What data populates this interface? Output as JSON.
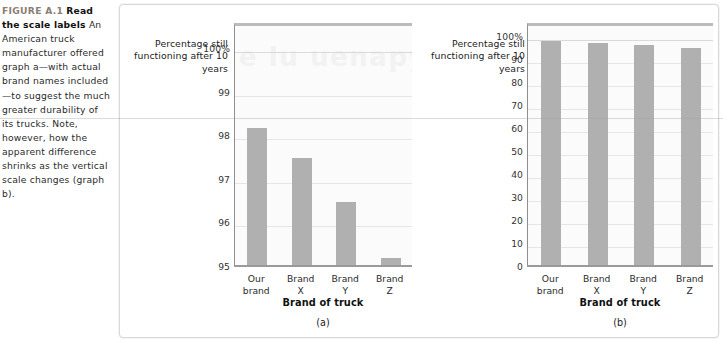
{
  "caption": {
    "figure_number": "FIGURE A.1",
    "title": "Read the scale labels",
    "body": " An American truck manufacturer offered graph a—with actual brand names included—to suggest the much greater durability of its trucks. Note, however, how the apparent difference shrinks as the vertical scale changes (graph b)."
  },
  "figure": {
    "watermark_text": "e lu uenapys",
    "bar_color": "#b0b0b0",
    "plot_background": "#fbfbfb",
    "gridline_color": "#e6e6e6",
    "frame_color": "#d8d8d8"
  },
  "chart_data": [
    {
      "id": "a",
      "type": "bar",
      "title": "",
      "panel_label": "(a)",
      "ylabel": "Percentage\nstill functioning\nafter 10 years",
      "xlabel": "Brand of truck",
      "categories": [
        "Our\nbrand",
        "Brand\nX",
        "Brand\nY",
        "Brand\nZ"
      ],
      "values": [
        98.2,
        97.5,
        96.5,
        95.2
      ],
      "ylim": [
        95,
        100.6
      ],
      "yticks": [
        95,
        96,
        97,
        98,
        99,
        100
      ],
      "ytick_labels": [
        "95",
        "96",
        "97",
        "98",
        "99",
        "100%"
      ],
      "grid": true,
      "legend": "none"
    },
    {
      "id": "b",
      "type": "bar",
      "title": "",
      "panel_label": "(b)",
      "ylabel": "Percentage\nstill functioning\nafter 10 years",
      "xlabel": "Brand of truck",
      "categories": [
        "Our\nbrand",
        "Brand\nX",
        "Brand\nY",
        "Brand\nZ"
      ],
      "values": [
        98.2,
        97.5,
        96.5,
        95.2
      ],
      "ylim": [
        0,
        106
      ],
      "yticks": [
        0,
        10,
        20,
        30,
        40,
        50,
        60,
        70,
        80,
        90,
        100
      ],
      "ytick_labels": [
        "0",
        "10",
        "20",
        "30",
        "40",
        "50",
        "60",
        "70",
        "80",
        "90",
        "100%"
      ],
      "grid": true,
      "legend": "none"
    }
  ]
}
